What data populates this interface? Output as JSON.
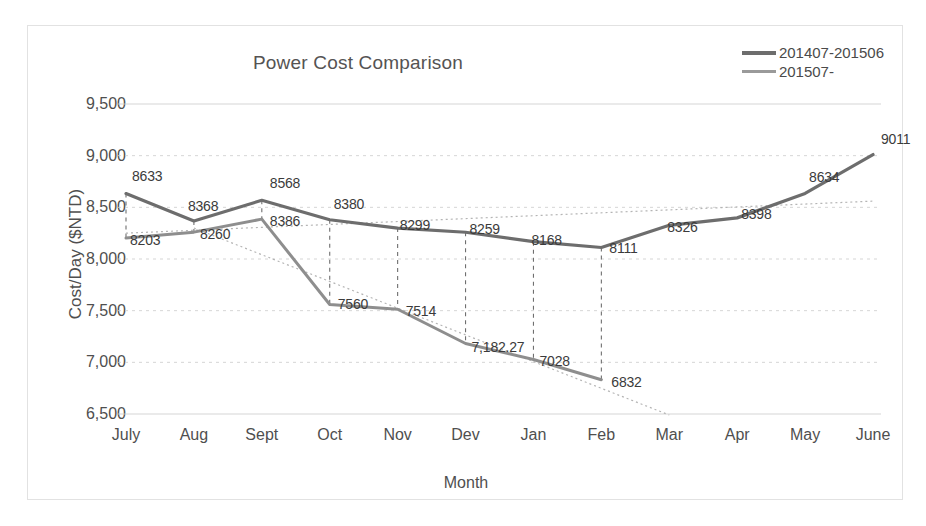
{
  "chart_data": {
    "type": "line",
    "title": "Power Cost Comparison",
    "xlabel": "Month",
    "ylabel": "Cost/Day ($NTD)",
    "categories": [
      "July",
      "Aug",
      "Sept",
      "Oct",
      "Nov",
      "Dev",
      "Jan",
      "Feb",
      "Mar",
      "Apr",
      "May",
      "June"
    ],
    "ylim": [
      6500,
      9500
    ],
    "yticks": [
      "6,500",
      "7,000",
      "7,500",
      "8,000",
      "8,500",
      "9,000",
      "9,500"
    ],
    "ytick_values": [
      6500,
      7000,
      7500,
      8000,
      8500,
      9000,
      9500
    ],
    "grid": true,
    "legend_position": "top-right",
    "series": [
      {
        "name": "201407-201506",
        "color": "#6d6d6d",
        "values": [
          8633,
          8368,
          8568,
          8380,
          8299,
          8259,
          8168,
          8111,
          8326,
          8398,
          8634,
          9011
        ],
        "labels": [
          "8633",
          "8368",
          "8568",
          "8380",
          "8299",
          "8259",
          "8168",
          "8111",
          "8326",
          "8398",
          "8634",
          "9011"
        ]
      },
      {
        "name": "201507-",
        "color": "#8e8e8e",
        "values": [
          8203,
          8260,
          8386,
          7560,
          7514,
          7182.27,
          7028,
          6832,
          null,
          null,
          null,
          null
        ],
        "labels": [
          "8203",
          "8260",
          "8386",
          "7560",
          "7514",
          "7,182.27",
          "7028",
          "6832",
          "",
          "",
          "",
          ""
        ]
      }
    ],
    "trendlines": [
      {
        "name": "trend-201407-201506",
        "style": "dotted",
        "from": [
          0,
          8250
        ],
        "to": [
          11,
          8560
        ]
      },
      {
        "name": "trend-201507",
        "style": "dotted",
        "from": [
          1,
          8300
        ],
        "to": [
          8,
          6490
        ]
      }
    ],
    "annotations": "Vertical dashed drop-lines connect the two series at each shared month."
  }
}
